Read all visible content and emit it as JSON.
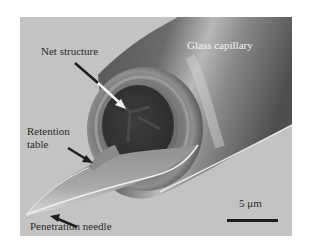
{
  "figure": {
    "type": "SEM micrograph",
    "labels": {
      "net_structure": "Net structure",
      "glass_capillary": "Glass capillary",
      "retention_table_line1": "Retention",
      "retention_table_line2": "table",
      "penetration_needle": "Penetration needle"
    },
    "scale_bar": {
      "label": "5 μm"
    },
    "colors": {
      "background": "#c3c3c3",
      "capillary_dark": "#5a5a5a",
      "lumen": "#3a3a3a",
      "arrow_dark": "#1e1e1e",
      "arrow_light": "#f5f5f5"
    }
  }
}
